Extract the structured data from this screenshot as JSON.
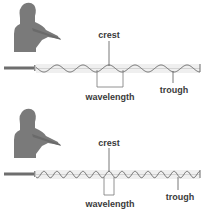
{
  "panels": [
    {
      "id": "low-frequency",
      "labels": {
        "crest": "crest",
        "wavelength": "wavelength",
        "trough": "trough"
      },
      "wave": {
        "cycles": 6.3,
        "relative_wavelength": 2
      }
    },
    {
      "id": "high-frequency",
      "labels": {
        "crest": "crest",
        "wavelength": "wavelength",
        "trough": "trough"
      },
      "wave": {
        "cycles": 12.6,
        "relative_wavelength": 1
      }
    }
  ],
  "colors": {
    "figure": "#7a7a7a",
    "wave": "#6a6a6a",
    "band": "#e6e6e6",
    "text": "#3a3a3a"
  }
}
